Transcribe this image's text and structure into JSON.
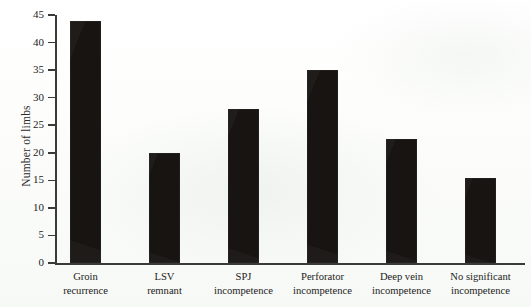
{
  "chart_data": {
    "type": "bar",
    "title": "",
    "xlabel": "",
    "ylabel": "Number of limbs",
    "ylim": [
      0,
      45
    ],
    "yticks": [
      0,
      5,
      10,
      15,
      20,
      25,
      30,
      35,
      40,
      45
    ],
    "grid": false,
    "legend": false,
    "bar_color": "#171412",
    "axis_color": "#3a3a38",
    "background_color": "#fbfcfa",
    "categories": [
      "Groin recurrence",
      "LSV remnant",
      "SPJ incompetence",
      "Perforator incompetence",
      "Deep vein incompetence",
      "No significant incompetence"
    ],
    "category_lines": [
      [
        "Groin",
        "recurrence"
      ],
      [
        "LSV",
        "remnant"
      ],
      [
        "SPJ",
        "incompetence"
      ],
      [
        "Perforator",
        "incompetence"
      ],
      [
        "Deep vein",
        "incompetence"
      ],
      [
        "No significant",
        "incompetence"
      ]
    ],
    "values": [
      44,
      20,
      28,
      35,
      22.5,
      15.5
    ]
  }
}
